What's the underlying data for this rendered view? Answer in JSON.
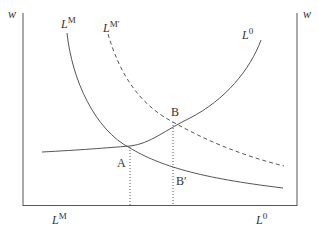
{
  "diagram": {
    "type": "labor-market-curves",
    "axes": {
      "left_label": "w",
      "right_label": "w",
      "bottom_left_label": "L",
      "bottom_left_sup": "M",
      "bottom_right_label": "L",
      "bottom_right_sup": "0"
    },
    "curves": [
      {
        "id": "LM",
        "label": "L",
        "sup": "M",
        "style": "solid"
      },
      {
        "id": "LMprime",
        "label": "L",
        "sup": "M'",
        "style": "dashed"
      },
      {
        "id": "L0",
        "label": "L",
        "sup": "0",
        "style": "solid"
      }
    ],
    "points": [
      {
        "id": "A",
        "label": "A"
      },
      {
        "id": "B",
        "label": "B"
      },
      {
        "id": "Bprime",
        "label": "B′"
      }
    ],
    "colors": {
      "line": "#555555",
      "text": "#333333"
    }
  }
}
